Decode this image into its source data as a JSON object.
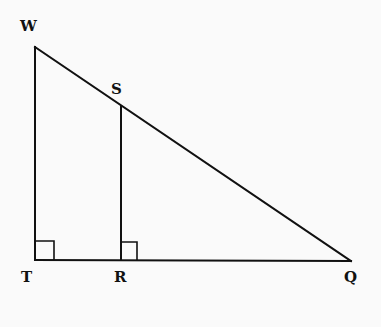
{
  "diagram": {
    "type": "geometry",
    "points": {
      "W": {
        "label": "W",
        "x": 35,
        "y": 47,
        "label_x": 26,
        "label_y": 30
      },
      "S": {
        "label": "S",
        "x": 121,
        "y": 106,
        "label_x": 117,
        "label_y": 93
      },
      "T": {
        "label": "T",
        "x": 35,
        "y": 260,
        "label_x": 26,
        "label_y": 281
      },
      "R": {
        "label": "R",
        "x": 121,
        "y": 260,
        "label_x": 120,
        "label_y": 281
      },
      "Q": {
        "label": "Q",
        "x": 351,
        "y": 261,
        "label_x": 347,
        "label_y": 281
      }
    },
    "segments": [
      {
        "from": "W",
        "to": "T"
      },
      {
        "from": "T",
        "to": "Q"
      },
      {
        "from": "W",
        "to": "Q"
      },
      {
        "from": "S",
        "to": "R"
      }
    ],
    "right_angles": [
      {
        "vertex": "T",
        "size": 18
      },
      {
        "vertex": "R",
        "size": 16
      }
    ],
    "colors": {
      "stroke": "#111111",
      "background": "#fafafa"
    }
  }
}
